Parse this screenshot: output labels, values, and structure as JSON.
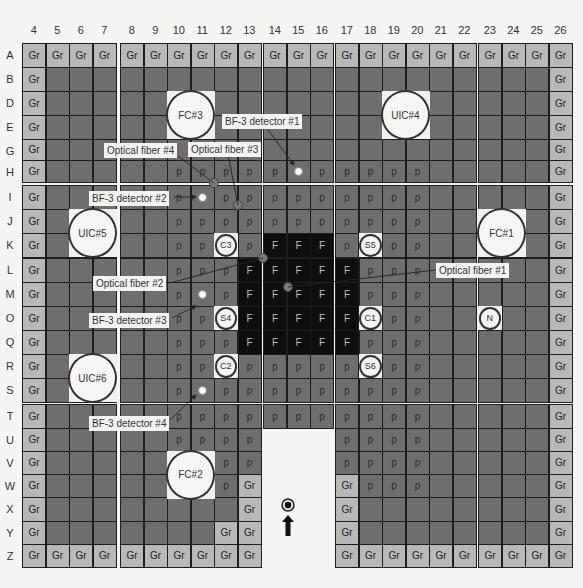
{
  "diagram": {
    "columns": [
      "4",
      "5",
      "6",
      "7",
      "8",
      "9",
      "10",
      "11",
      "12",
      "13",
      "14",
      "15",
      "16",
      "17",
      "18",
      "19",
      "20",
      "21",
      "22",
      "23",
      "24",
      "25",
      "26"
    ],
    "rows": [
      "A",
      "B",
      "D",
      "E",
      "G",
      "H",
      "I",
      "J",
      "K",
      "L",
      "M",
      "O",
      "Q",
      "R",
      "S",
      "T",
      "U",
      "V",
      "W",
      "X",
      "Y",
      "Z"
    ],
    "legend_codes": {
      "Gr": "graphite reflector",
      "p": "polyethylene moderator",
      "F": "fuel"
    },
    "cells": {
      "A": {
        "4": "Gr",
        "5": "Gr",
        "6": "Gr",
        "7": "Gr",
        "8": "Gr",
        "9": "Gr",
        "10": "Gr",
        "11": "Gr",
        "12": "Gr",
        "13": "Gr",
        "14": "Gr",
        "15": "Gr",
        "16": "Gr",
        "17": "Gr",
        "18": "Gr",
        "19": "Gr",
        "20": "Gr",
        "21": "Gr",
        "22": "Gr",
        "23": "Gr",
        "24": "Gr",
        "25": "Gr",
        "26": "Gr"
      },
      "B": {
        "4": "Gr",
        "26": "Gr"
      },
      "D": {
        "4": "Gr",
        "26": "Gr"
      },
      "E": {
        "4": "Gr",
        "26": "Gr"
      },
      "G": {
        "4": "Gr",
        "26": "Gr"
      },
      "H": {
        "4": "Gr",
        "10": "p",
        "11": "p",
        "12": "p",
        "13": "p",
        "14": "p",
        "16": "p",
        "17": "p",
        "18": "p",
        "19": "p",
        "20": "p",
        "26": "Gr"
      },
      "I": {
        "4": "Gr",
        "10": "p",
        "12": "p",
        "13": "p",
        "14": "p",
        "15": "p",
        "16": "p",
        "17": "p",
        "18": "p",
        "19": "p",
        "20": "p",
        "26": "Gr"
      },
      "J": {
        "4": "Gr",
        "10": "p",
        "11": "p",
        "12": "p",
        "13": "p",
        "14": "p",
        "15": "p",
        "16": "p",
        "17": "p",
        "18": "p",
        "19": "p",
        "20": "p",
        "26": "Gr"
      },
      "K": {
        "4": "Gr",
        "10": "p",
        "11": "p",
        "13": "p",
        "14": "F",
        "15": "F",
        "16": "F",
        "17": "p",
        "19": "p",
        "20": "p",
        "26": "Gr"
      },
      "L": {
        "4": "Gr",
        "10": "p",
        "11": "p",
        "12": "p",
        "13": "F",
        "14": "F",
        "15": "F",
        "16": "F",
        "17": "F",
        "18": "p",
        "19": "p",
        "20": "p",
        "26": "Gr"
      },
      "M": {
        "4": "Gr",
        "10": "p",
        "12": "p",
        "13": "F",
        "14": "F",
        "15": "F",
        "16": "F",
        "17": "F",
        "18": "p",
        "19": "p",
        "20": "p",
        "26": "Gr"
      },
      "O": {
        "4": "Gr",
        "10": "p",
        "11": "p",
        "13": "F",
        "14": "F",
        "15": "F",
        "16": "F",
        "17": "F",
        "19": "p",
        "20": "p",
        "26": "Gr"
      },
      "Q": {
        "4": "Gr",
        "10": "p",
        "11": "p",
        "12": "p",
        "13": "F",
        "14": "F",
        "15": "F",
        "16": "F",
        "17": "F",
        "18": "p",
        "19": "p",
        "20": "p",
        "26": "Gr"
      },
      "R": {
        "4": "Gr",
        "10": "p",
        "11": "p",
        "13": "p",
        "14": "p",
        "15": "p",
        "16": "p",
        "17": "p",
        "19": "p",
        "20": "p",
        "26": "Gr"
      },
      "S": {
        "4": "Gr",
        "10": "p",
        "12": "p",
        "13": "p",
        "14": "p",
        "15": "p",
        "16": "p",
        "17": "p",
        "18": "p",
        "19": "p",
        "20": "p",
        "26": "Gr"
      },
      "T": {
        "4": "Gr",
        "10": "p",
        "11": "p",
        "12": "p",
        "13": "p",
        "14": "p",
        "15": "p",
        "16": "p",
        "17": "p",
        "18": "p",
        "19": "p",
        "20": "p",
        "26": "Gr"
      },
      "U": {
        "4": "Gr",
        "10": "p",
        "11": "p",
        "12": "p",
        "13": "p",
        "17": "p",
        "18": "p",
        "19": "p",
        "20": "p",
        "26": "Gr"
      },
      "V": {
        "4": "Gr",
        "12": "p",
        "13": "p",
        "17": "p",
        "18": "p",
        "19": "p",
        "20": "p",
        "26": "Gr"
      },
      "W": {
        "4": "Gr",
        "12": "p",
        "13": "Gr",
        "17": "Gr",
        "18": "p",
        "19": "p",
        "20": "p",
        "26": "Gr"
      },
      "X": {
        "4": "Gr",
        "13": "Gr",
        "17": "Gr",
        "26": "Gr"
      },
      "Y": {
        "4": "Gr",
        "12": "Gr",
        "13": "Gr",
        "17": "Gr",
        "26": "Gr"
      },
      "Z": {
        "4": "Gr",
        "5": "Gr",
        "6": "Gr",
        "7": "Gr",
        "8": "Gr",
        "9": "Gr",
        "10": "Gr",
        "11": "Gr",
        "12": "Gr",
        "13": "Gr",
        "17": "Gr",
        "18": "Gr",
        "19": "Gr",
        "20": "Gr",
        "21": "Gr",
        "22": "Gr",
        "23": "Gr",
        "24": "Gr",
        "25": "Gr",
        "26": "Gr"
      }
    },
    "absent_cells": {
      "U": [
        "14",
        "15",
        "16"
      ],
      "V": [
        "14",
        "15",
        "16"
      ],
      "W": [
        "14",
        "15",
        "16"
      ],
      "X": [
        "14",
        "15",
        "16"
      ],
      "Y": [
        "14",
        "15",
        "16"
      ],
      "Z": [
        "14",
        "15",
        "16"
      ]
    },
    "large_chambers": [
      {
        "label": "FC#3",
        "col": "10",
        "row": "D",
        "span": 2
      },
      {
        "label": "UIC#4",
        "col": "19",
        "row": "D",
        "span": 2
      },
      {
        "label": "UIC#5",
        "col": "6",
        "row": "J",
        "span": 2
      },
      {
        "label": "FC#1",
        "col": "23",
        "row": "J",
        "span": 2
      },
      {
        "label": "UIC#6",
        "col": "6",
        "row": "R",
        "span": 2
      },
      {
        "label": "FC#2",
        "col": "10",
        "row": "V",
        "span": 2
      }
    ],
    "small_elements": [
      {
        "label": "C3",
        "col": "12",
        "row": "K"
      },
      {
        "label": "S5",
        "col": "18",
        "row": "K"
      },
      {
        "label": "S4",
        "col": "12",
        "row": "O"
      },
      {
        "label": "C1",
        "col": "18",
        "row": "O"
      },
      {
        "label": "N",
        "col": "23",
        "row": "O"
      },
      {
        "label": "C2",
        "col": "12",
        "row": "R"
      },
      {
        "label": "S6",
        "col": "18",
        "row": "R"
      }
    ],
    "detectors": [
      {
        "label": "BF-3 detector #1",
        "col": "15",
        "row": "H"
      },
      {
        "label": "BF-3 detector #2",
        "col": "11",
        "row": "I"
      },
      {
        "label": "BF-3 detector #3",
        "col": "11",
        "row": "M"
      },
      {
        "label": "BF-3 detector #4",
        "col": "11",
        "row": "S"
      }
    ],
    "callouts": [
      {
        "id": "bf1",
        "label": "BF-3 detector #1",
        "x": 222,
        "y": 114
      },
      {
        "id": "of4",
        "label": "Optical fiber #4",
        "x": 104,
        "y": 143
      },
      {
        "id": "of3",
        "label": "Optical fiber #3",
        "x": 188,
        "y": 142
      },
      {
        "id": "bf2",
        "label": "BF-3 detector #2",
        "x": 89,
        "y": 191
      },
      {
        "id": "of2",
        "label": "Optical fiber #2",
        "x": 93,
        "y": 276
      },
      {
        "id": "of1",
        "label": "Optical fiber #1",
        "x": 436,
        "y": 263
      },
      {
        "id": "bf3",
        "label": "BF-3 detector #3",
        "x": 89,
        "y": 313
      },
      {
        "id": "bf4",
        "label": "BF-3 detector #4",
        "x": 89,
        "y": 416
      }
    ],
    "source_marker": {
      "label": "neutron-source-arrow",
      "x": 288,
      "y": 505
    }
  },
  "colors": {
    "moderator": "#6e6e6e",
    "reflector": "#b8b8b8",
    "fuel": "#0e0e0e",
    "gap": "#f4f4f2"
  }
}
